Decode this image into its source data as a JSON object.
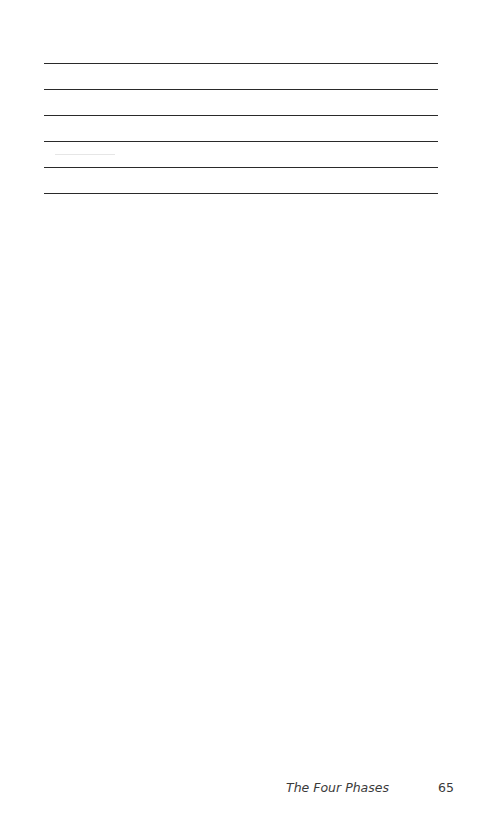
{
  "page": {
    "ruled_lines_count": 6,
    "footer": {
      "running_head": "The Four Phases",
      "page_number": "65"
    }
  }
}
